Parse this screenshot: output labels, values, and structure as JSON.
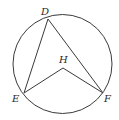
{
  "figure": {
    "type": "geometry",
    "colors": {
      "stroke": "#3a3a3a",
      "label": "#2a2a2a",
      "background": "#ffffff"
    },
    "circle": {
      "cx": 62.5,
      "cy": 64,
      "r": 49.5
    },
    "points": {
      "D": {
        "x": 48,
        "y": 19,
        "label": "D",
        "label_x": 41,
        "label_y": 15
      },
      "E": {
        "x": 24,
        "y": 93,
        "label": "E",
        "label_x": 12,
        "label_y": 102
      },
      "F": {
        "x": 103,
        "y": 93,
        "label": "F",
        "label_x": 104,
        "label_y": 102
      },
      "H": {
        "x": 63,
        "y": 68,
        "label": "H",
        "label_x": 59,
        "label_y": 63
      }
    },
    "segments": [
      [
        "D",
        "E"
      ],
      [
        "D",
        "F"
      ],
      [
        "H",
        "E"
      ],
      [
        "H",
        "F"
      ]
    ]
  }
}
